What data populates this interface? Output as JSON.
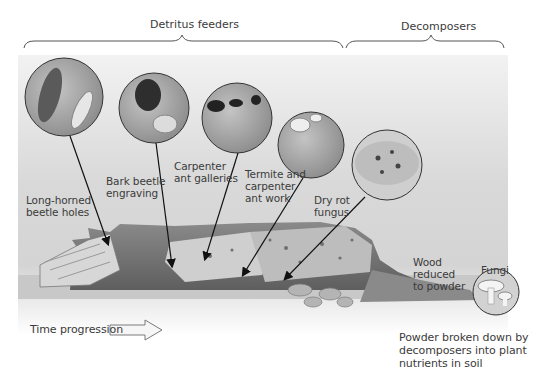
{
  "diagram": {
    "groups": [
      {
        "label": "Detritus feeders"
      },
      {
        "label": "Decomposers"
      }
    ],
    "callouts": [
      {
        "label": "Long-horned\nbeetle holes",
        "icon": "long-horned-beetle-and-larva"
      },
      {
        "label": "Bark beetle\nengraving",
        "icon": "bark-beetle-and-larva"
      },
      {
        "label": "Carpenter\nant galleries",
        "icon": "carpenter-ant"
      },
      {
        "label": "Termite and\ncarpenter\nant work",
        "icon": "termite"
      },
      {
        "label": "Dry rot\nfungus",
        "icon": "dry-rot-fungus"
      }
    ],
    "wood_label": "Wood\nreduced\nto powder",
    "fungi_label": "Fungi",
    "powder_label": "Powder broken down by\ndecomposers into plant\nnutrients in soil",
    "time_label": "Time progression",
    "colors": {
      "background": "#d8d8d8",
      "log_dark": "#6e6e6e",
      "log_light": "#c9c9c9",
      "circle_fill": "#9a9a9a",
      "line": "#111111",
      "text": "#3b3b3b"
    }
  }
}
